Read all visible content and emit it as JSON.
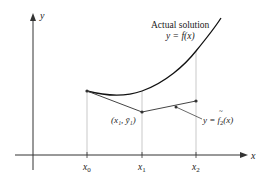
{
  "diagram": {
    "axes": {
      "x_label": "x",
      "y_label": "y"
    },
    "ticks": [
      {
        "name": "x0",
        "base": "x",
        "sub": "0"
      },
      {
        "name": "x1",
        "base": "x",
        "sub": "1"
      },
      {
        "name": "x2",
        "base": "x",
        "sub": "2"
      }
    ],
    "curve_label": {
      "line1": "Actual solution",
      "line2": "y = f(x)"
    },
    "point_label": {
      "text": "(x₁, ȳ₁)"
    },
    "approx_label": {
      "prefix": "y = ",
      "func": "f",
      "sub": "2",
      "suffix": "(x)"
    },
    "colors": {
      "curve": "#111111",
      "approx": "#444444",
      "gridline": "#bbbbbb",
      "axis": "#333333"
    }
  }
}
